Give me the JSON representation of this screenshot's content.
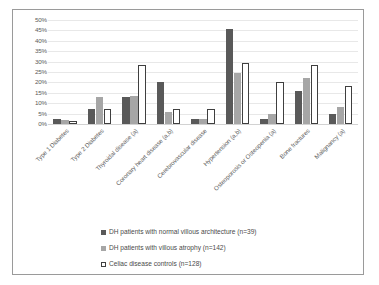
{
  "chart_data": {
    "type": "bar",
    "title": "",
    "xlabel": "",
    "ylabel": "",
    "ylim": [
      0,
      50
    ],
    "ytick_labels": [
      "50%",
      "45%",
      "40%",
      "35%",
      "30%",
      "25%",
      "20%",
      "15%",
      "10%",
      "5%",
      "0%"
    ],
    "ytick_values": [
      50,
      45,
      40,
      35,
      30,
      25,
      20,
      15,
      10,
      5,
      0
    ],
    "grid": true,
    "legend_position": "bottom",
    "categories": [
      "Type 1 Diabetes",
      "Type 2 Diabetes",
      "Thyroidal disease (a)",
      "Coronary heart disease (a,b)",
      "Cerebrovascular disease",
      "Hypertension (a,b)",
      "Osteoporosis or Osteopenia (a)",
      "Bone fractures",
      "Malignancy (a)"
    ],
    "series": [
      {
        "name": "DH patients with normal villous architecture (n=39)",
        "color": "#595959",
        "values": [
          2.5,
          7.0,
          12.8,
          20.0,
          2.5,
          45.5,
          2.5,
          15.9,
          5.0
        ]
      },
      {
        "name": "DH patients with villous atrophy (n=142)",
        "color": "#a6a6a6",
        "values": [
          2.0,
          12.9,
          13.3,
          6.0,
          2.5,
          24.5,
          5.0,
          22.0,
          8.0
        ]
      },
      {
        "name": "Celiac disease controls (n=128)",
        "color": "#ffffff",
        "values": [
          1.3,
          7.0,
          28.5,
          7.0,
          7.0,
          29.5,
          20.0,
          28.5,
          18.5
        ]
      }
    ]
  },
  "legend": {
    "items": [
      {
        "label": "DH patients with normal villous architecture (n=39)"
      },
      {
        "label": "DH patients with villous atrophy (n=142)"
      },
      {
        "label": "Celiac disease controls (n=128)"
      }
    ]
  }
}
